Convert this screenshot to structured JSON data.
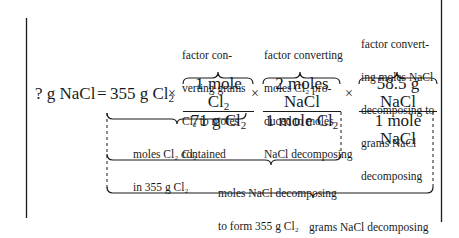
{
  "equation": {
    "lhs": "? g NaCl",
    "equals": "=",
    "given": {
      "text": "355 g Cl",
      "sub": "2"
    },
    "times": "×",
    "factors": [
      {
        "num": {
          "text": "1 mole Cl",
          "sub": "2"
        },
        "den": {
          "text": "71 g Cl",
          "sub": "2"
        }
      },
      {
        "num": {
          "text": "2 moles NaCl",
          "sub": ""
        },
        "den": {
          "text": "1 mole Cl",
          "sub": "2"
        }
      },
      {
        "num": {
          "text": "58.5 g NaCl",
          "sub": ""
        },
        "den": {
          "text": "1 mole NaCl",
          "sub": ""
        }
      }
    ]
  },
  "top_notes": [
    {
      "lines": [
        "factor con-",
        "verting grams",
        "Cl₂ to moles",
        "Cl₂"
      ]
    },
    {
      "lines": [
        "factor converting",
        "moles Cl₂ pro-",
        "duced to moles",
        "NaCl decomposing"
      ]
    },
    {
      "lines": [
        "factor convert-",
        "ing moles NaCl",
        "decomposing to",
        "grams NaCl",
        "decomposing"
      ]
    }
  ],
  "bottom_notes": [
    {
      "lines": [
        "moles Cl₂ contained",
        "in 355 g Cl₂"
      ]
    },
    {
      "lines": [
        "moles NaCl decomposing",
        "to form 355 g Cl₂"
      ]
    },
    {
      "lines": [
        "grams NaCl decomposing",
        "to produce 355 g Cl₂"
      ]
    }
  ],
  "colors": {
    "ink": "#1a1a1a",
    "background": "#ffffff"
  }
}
